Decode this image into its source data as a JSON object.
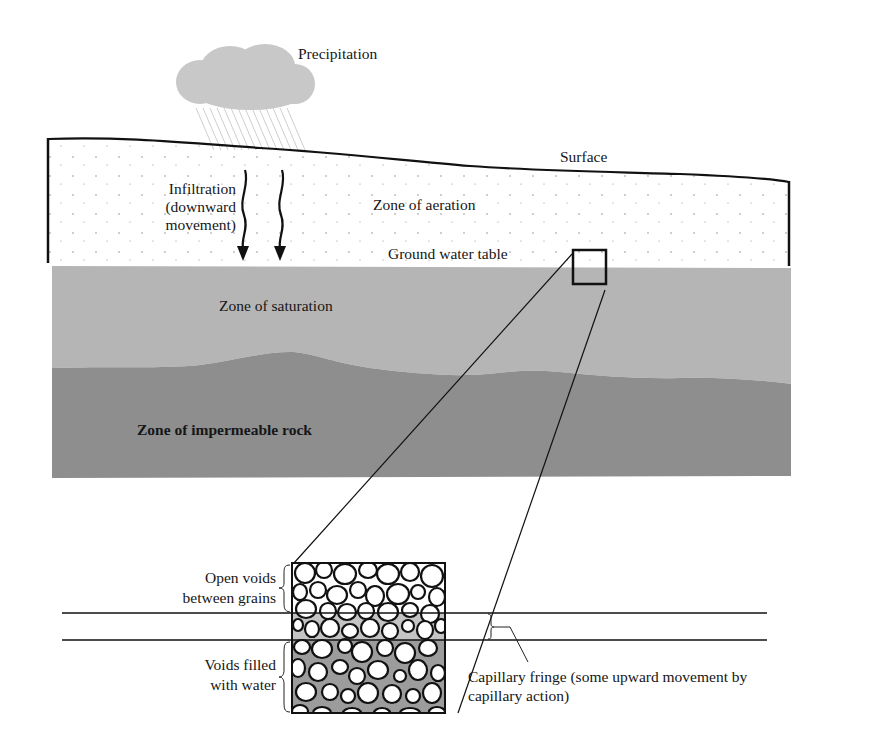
{
  "diagram": {
    "type": "groundwater-cross-section",
    "colors": {
      "background": "#ffffff",
      "cloud": "#c8c8c8",
      "rain": "#cfcfcf",
      "aeration_zone": "#ffffff",
      "saturation_zone": "#b5b5b5",
      "impermeable_rock": "#8e8e8e",
      "water_in_voids": "#9c9c9c",
      "capillary_fringe": "#c4c4c4",
      "ink": "#111111"
    },
    "labels": {
      "precipitation": "Precipitation",
      "surface": "Surface",
      "infiltration_line1": "Infiltration",
      "infiltration_line2": "(downward",
      "infiltration_line3": "movement)",
      "zone_aeration": "Zone of aeration",
      "ground_water_table": "Ground water table",
      "zone_saturation": "Zone of saturation",
      "zone_impermeable": "Zone of impermeable rock",
      "open_voids_line1": "Open voids",
      "open_voids_line2": "between grains",
      "voids_filled_line1": "Voids filled",
      "voids_filled_line2": "with water",
      "capillary_line1": "Capillary fringe (some upward movement by",
      "capillary_line2": "capillary action)"
    },
    "icons": {
      "cloud": "rain-cloud-icon",
      "infiltration_arrows": "wavy-down-arrow-icon",
      "detail_box": "magnify-box-icon"
    }
  }
}
